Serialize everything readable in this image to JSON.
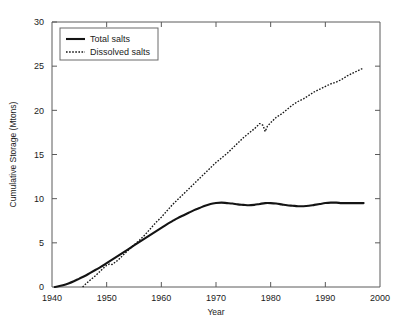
{
  "chart_data": {
    "type": "line",
    "title": "",
    "xlabel": "Year",
    "ylabel": "Cumulative Storage (Mtons)",
    "xlim": [
      1940,
      2000
    ],
    "ylim": [
      0,
      30
    ],
    "xticks": [
      "1940",
      "1950",
      "1960",
      "1970",
      "1980",
      "1990",
      "2000"
    ],
    "yticks": [
      "0",
      "5",
      "10",
      "15",
      "20",
      "25",
      "30"
    ],
    "grid": false,
    "legend_position": "top-left",
    "legend": [
      "Total salts",
      "Dissolved salts"
    ],
    "series": [
      {
        "name": "Total salts",
        "style": "solid",
        "color": "#141414",
        "x": [
          1940.5,
          1941,
          1942,
          1943,
          1944,
          1945,
          1946,
          1947,
          1948,
          1949,
          1950,
          1951,
          1952,
          1953,
          1954,
          1955,
          1956,
          1957,
          1958,
          1959,
          1960,
          1961,
          1962,
          1963,
          1964,
          1965,
          1966,
          1967,
          1968,
          1969,
          1970,
          1971,
          1972,
          1973,
          1974,
          1975,
          1976,
          1977,
          1978,
          1979,
          1980,
          1981,
          1982,
          1983,
          1984,
          1985,
          1986,
          1987,
          1988,
          1989,
          1990,
          1991,
          1992,
          1993,
          1994,
          1995,
          1996,
          1997
        ],
        "y": [
          0.0,
          0.05,
          0.2,
          0.4,
          0.65,
          0.95,
          1.25,
          1.6,
          1.95,
          2.3,
          2.7,
          3.1,
          3.5,
          3.9,
          4.3,
          4.7,
          5.1,
          5.5,
          5.9,
          6.3,
          6.7,
          7.1,
          7.45,
          7.8,
          8.1,
          8.4,
          8.7,
          8.95,
          9.2,
          9.4,
          9.5,
          9.55,
          9.5,
          9.45,
          9.35,
          9.3,
          9.25,
          9.3,
          9.4,
          9.5,
          9.5,
          9.45,
          9.35,
          9.25,
          9.2,
          9.15,
          9.15,
          9.2,
          9.3,
          9.4,
          9.5,
          9.55,
          9.55,
          9.5,
          9.5,
          9.5,
          9.5,
          9.5
        ]
      },
      {
        "name": "Dissolved salts",
        "style": "dotted",
        "color": "#141414",
        "x": [
          1945.6,
          1946,
          1947,
          1948,
          1949,
          1950,
          1950.5,
          1951,
          1952,
          1953,
          1954,
          1955,
          1956,
          1957,
          1958,
          1959,
          1960,
          1961,
          1962,
          1963,
          1964,
          1965,
          1966,
          1967,
          1968,
          1969,
          1970,
          1971,
          1972,
          1973,
          1974,
          1975,
          1976,
          1977,
          1978,
          1978.6,
          1979,
          1979.4,
          1980,
          1981,
          1982,
          1983,
          1984,
          1985,
          1986,
          1987,
          1988,
          1989,
          1990,
          1991,
          1992,
          1993,
          1994,
          1995,
          1996,
          1997
        ],
        "y": [
          0.0,
          0.25,
          0.8,
          1.3,
          1.9,
          2.45,
          2.6,
          2.55,
          3.0,
          3.6,
          4.2,
          4.75,
          5.3,
          5.9,
          6.6,
          7.3,
          7.9,
          8.6,
          9.3,
          9.9,
          10.5,
          11.1,
          11.7,
          12.3,
          12.9,
          13.5,
          14.1,
          14.6,
          15.1,
          15.7,
          16.3,
          16.9,
          17.4,
          17.9,
          18.5,
          18.3,
          17.6,
          18.2,
          18.6,
          19.2,
          19.6,
          20.1,
          20.6,
          21.0,
          21.3,
          21.7,
          22.1,
          22.4,
          22.7,
          23.0,
          23.2,
          23.5,
          23.9,
          24.2,
          24.5,
          24.8
        ]
      }
    ]
  }
}
